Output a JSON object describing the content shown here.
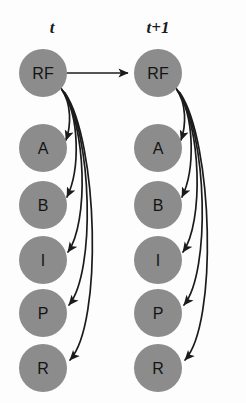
{
  "figure": {
    "type": "two-slice-temporal-bayesian-network",
    "background_color": "#fdfdfd",
    "node_fill_color": "#8c8c8c",
    "edge_color": "#1b1b1b",
    "label_color": "#141414"
  },
  "slices": [
    {
      "id": "slice-t",
      "label": "t",
      "label_x": 52,
      "label_y": 33,
      "center_x": 43,
      "nodes": [
        {
          "id": "t-RF",
          "label": "RF",
          "cx": 43,
          "cy": 73,
          "rx": 24,
          "ry": 24
        },
        {
          "id": "t-A",
          "label": "A",
          "cx": 43,
          "cy": 148,
          "rx": 24,
          "ry": 24
        },
        {
          "id": "t-B",
          "label": "B",
          "cx": 43,
          "cy": 205,
          "rx": 24,
          "ry": 24
        },
        {
          "id": "t-I",
          "label": "I",
          "cx": 43,
          "cy": 260,
          "rx": 24,
          "ry": 24
        },
        {
          "id": "t-P",
          "label": "P",
          "cx": 43,
          "cy": 313,
          "rx": 24,
          "ry": 24
        },
        {
          "id": "t-R",
          "label": "R",
          "cx": 43,
          "cy": 368,
          "rx": 24,
          "ry": 24
        }
      ]
    },
    {
      "id": "slice-t-plus-1",
      "label": "t+1",
      "label_x": 158,
      "label_y": 33,
      "center_x": 158,
      "nodes": [
        {
          "id": "tp1-RF",
          "label": "RF",
          "cx": 158,
          "cy": 73,
          "rx": 24,
          "ry": 24
        },
        {
          "id": "tp1-A",
          "label": "A",
          "cx": 158,
          "cy": 148,
          "rx": 24,
          "ry": 24
        },
        {
          "id": "tp1-B",
          "label": "B",
          "cx": 158,
          "cy": 205,
          "rx": 24,
          "ry": 24
        },
        {
          "id": "tp1-I",
          "label": "I",
          "cx": 158,
          "cy": 260,
          "rx": 24,
          "ry": 24
        },
        {
          "id": "tp1-P",
          "label": "P",
          "cx": 158,
          "cy": 313,
          "rx": 24,
          "ry": 24
        },
        {
          "id": "tp1-R",
          "label": "R",
          "cx": 158,
          "cy": 368,
          "rx": 24,
          "ry": 24
        }
      ]
    }
  ],
  "edges": {
    "temporal": [
      {
        "id": "edge-t-RF-to-tp1-RF",
        "from": "t-RF",
        "to": "tp1-RF",
        "style": "straight"
      }
    ],
    "intra_slice_t": [
      {
        "id": "edge-t-RF-to-t-A",
        "from": "t-RF",
        "to": "t-A"
      },
      {
        "id": "edge-t-RF-to-t-B",
        "from": "t-RF",
        "to": "t-B"
      },
      {
        "id": "edge-t-RF-to-t-I",
        "from": "t-RF",
        "to": "t-I"
      },
      {
        "id": "edge-t-RF-to-t-P",
        "from": "t-RF",
        "to": "t-P"
      },
      {
        "id": "edge-t-RF-to-t-R",
        "from": "t-RF",
        "to": "t-R"
      }
    ],
    "intra_slice_tp1": [
      {
        "id": "edge-tp1-RF-to-tp1-A",
        "from": "tp1-RF",
        "to": "tp1-A"
      },
      {
        "id": "edge-tp1-RF-to-tp1-B",
        "from": "tp1-RF",
        "to": "tp1-B"
      },
      {
        "id": "edge-tp1-RF-to-tp1-I",
        "from": "tp1-RF",
        "to": "tp1-I"
      },
      {
        "id": "edge-tp1-RF-to-tp1-P",
        "from": "tp1-RF",
        "to": "tp1-P"
      },
      {
        "id": "edge-tp1-RF-to-tp1-R",
        "from": "tp1-RF",
        "to": "tp1-R"
      }
    ]
  }
}
